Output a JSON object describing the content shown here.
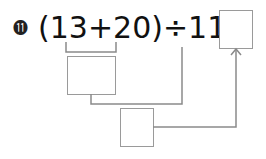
{
  "problem": {
    "number_label": "⓫",
    "open_paren": "(",
    "operand_a": "13",
    "plus": "+",
    "operand_b": "20",
    "close_paren": ")",
    "divide": "÷",
    "operand_c": "11",
    "equals": "="
  },
  "boxes": {
    "sum_box": "",
    "quotient_box": "",
    "answer_box": ""
  },
  "colors": {
    "text": "#111111",
    "lines": "#8a8a8a"
  }
}
